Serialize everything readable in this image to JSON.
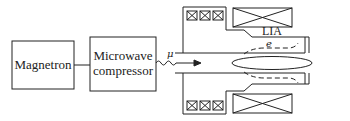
{
  "diagram": {
    "title": "",
    "blocks": [
      {
        "id": "magnetron",
        "label": "Magnetron"
      },
      {
        "id": "compressor",
        "label_line1": "Microwave",
        "label_line2": "compressor"
      }
    ],
    "labels": {
      "microwave_symbol": "μ",
      "electron_symbol": "e",
      "accelerator": "LIA"
    },
    "connections": [
      {
        "from": "magnetron",
        "to": "compressor",
        "type": "line"
      },
      {
        "from": "compressor",
        "to": "accelerator",
        "type": "wavy-arrow",
        "label": "μ"
      }
    ],
    "colors": {
      "stroke": "#222222",
      "background": "#ffffff"
    }
  }
}
